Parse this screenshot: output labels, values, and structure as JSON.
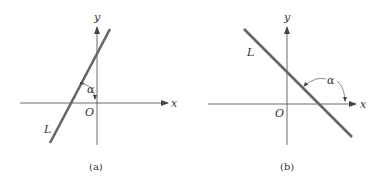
{
  "panels": [
    {
      "caption": "(a)",
      "x_label": "x",
      "y_label": "y",
      "origin_label": "O",
      "line_label": "L",
      "angle_label": "α",
      "slope": "positive"
    },
    {
      "caption": "(b)",
      "x_label": "x",
      "y_label": "y",
      "origin_label": "O",
      "line_label": "L",
      "angle_label": "α",
      "slope": "negative"
    }
  ],
  "colors": {
    "line": "#666666",
    "axis": "#444444"
  }
}
